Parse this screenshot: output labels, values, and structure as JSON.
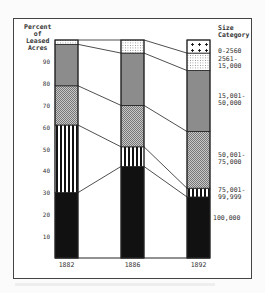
{
  "chart_data": {
    "type": "bar",
    "stacked": true,
    "title": "",
    "ylabel": "Percent of Leased Acres",
    "legend_title": "Size Category",
    "categories": [
      "1882",
      "1886",
      "1892"
    ],
    "yticks": [
      10,
      20,
      30,
      40,
      50,
      60,
      70,
      80,
      90
    ],
    "ylim": [
      0,
      100
    ],
    "series": [
      {
        "name": "100,000",
        "pattern": "solid-black",
        "values": [
          30,
          42,
          28
        ]
      },
      {
        "name": "75,001-99,999",
        "pattern": "vertical-stripes",
        "values": [
          31,
          9,
          4
        ]
      },
      {
        "name": "50,001-75,000",
        "pattern": "checker",
        "values": [
          18,
          19,
          26
        ]
      },
      {
        "name": "15,001-50,000",
        "pattern": "gray",
        "values": [
          19,
          24,
          28
        ]
      },
      {
        "name": "2561-15,000",
        "pattern": "dots",
        "values": [
          2,
          6,
          8
        ]
      },
      {
        "name": "0-2560",
        "pattern": "crosses",
        "values": [
          0,
          0,
          6
        ]
      }
    ]
  },
  "labels": {
    "ylabel_lines": [
      "Percent",
      "of",
      "Leased",
      "Acres"
    ],
    "legend_title_lines": [
      "Size",
      "Category"
    ],
    "legend_entries": [
      {
        "text": "0-2560",
        "y": 48
      },
      {
        "text": "2561-\n15,000",
        "y": 56
      },
      {
        "text": "15,001-\n50,000",
        "y": 93
      },
      {
        "text": "50,001-\n75,000",
        "y": 152
      },
      {
        "text": "75,001-\n99,999",
        "y": 187
      },
      {
        "text": "100,000",
        "y": 215
      }
    ]
  }
}
